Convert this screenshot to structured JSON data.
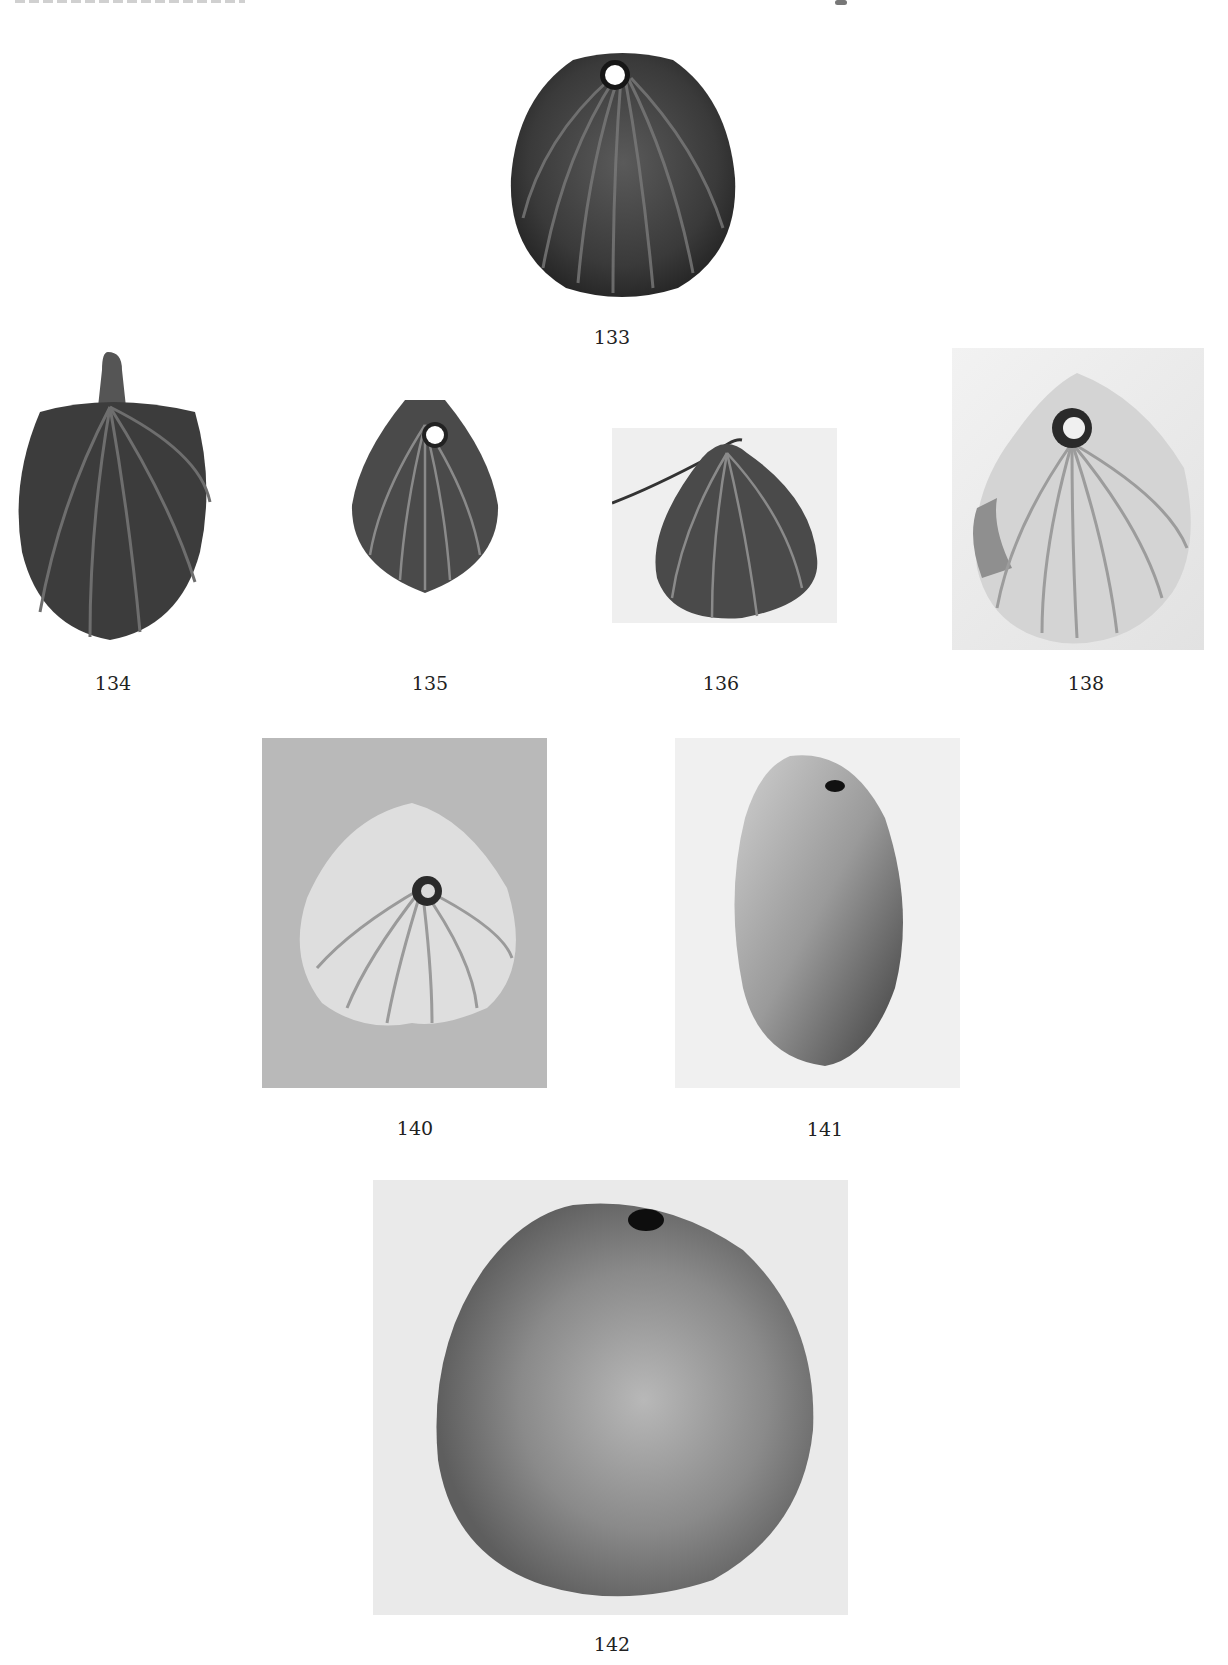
{
  "plate": {
    "figures": [
      {
        "number": "133",
        "description": "scallop shell pendant, dark, pierced"
      },
      {
        "number": "134",
        "description": "scallop shell pendant with suspension loop, dark"
      },
      {
        "number": "135",
        "description": "small scallop shell pendant, pierced"
      },
      {
        "number": "136",
        "description": "scallop shell pendant with wire"
      },
      {
        "number": "138",
        "description": "pale scallop shell, pierced"
      },
      {
        "number": "140",
        "description": "pale scallop shell, pierced"
      },
      {
        "number": "141",
        "description": "cowrie shell, pierced"
      },
      {
        "number": "142",
        "description": "worn round shell, pierced"
      }
    ]
  },
  "colors": {
    "page_background": "#ffffff",
    "dark_shell": "#3a3a3a",
    "light_shell": "#d8d8d8",
    "photo_background_light": "#ececec",
    "photo_background_grey": "#b9b9b9"
  }
}
